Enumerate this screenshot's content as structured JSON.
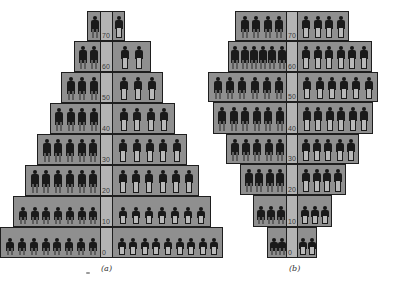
{
  "chart_data": [
    {
      "type": "bar",
      "subtype": "population-pyramid-isotype",
      "title": "",
      "caption": "(a)",
      "xlabel": "",
      "ylabel": "",
      "age_axis_ticks": [
        "0",
        "10",
        "20",
        "30",
        "40",
        "50",
        "60",
        "70"
      ],
      "categories": [
        "0",
        "10",
        "20",
        "30",
        "40",
        "50",
        "60",
        "70"
      ],
      "series": [
        {
          "name": "male (left)",
          "values": [
            8,
            7,
            6,
            5,
            4,
            3,
            2,
            1
          ]
        },
        {
          "name": "female (right)",
          "values": [
            9,
            7,
            6,
            5,
            4,
            3,
            2,
            1
          ]
        }
      ],
      "grid": false,
      "legend": "none",
      "colors": {
        "box": "#8f8f8f",
        "strip": "#b4b4b4",
        "figure": "#1a1a1a",
        "border": "#1e1e1e"
      }
    },
    {
      "type": "bar",
      "subtype": "population-pyramid-isotype",
      "title": "",
      "caption": "(b)",
      "xlabel": "",
      "ylabel": "",
      "age_axis_ticks": [
        "0",
        "10",
        "20",
        "30",
        "40",
        "50",
        "60",
        "70"
      ],
      "categories": [
        "0",
        "10",
        "20",
        "30",
        "40",
        "50",
        "60",
        "70"
      ],
      "series": [
        {
          "name": "male (left)",
          "values": [
            2,
            3,
            4,
            5,
            6,
            6,
            6,
            4
          ]
        },
        {
          "name": "female (right)",
          "values": [
            2,
            3,
            4,
            5,
            6,
            6,
            6,
            4
          ]
        }
      ],
      "grid": false,
      "legend": "none",
      "colors": {
        "box": "#8f8f8f",
        "strip": "#b4b4b4",
        "figure": "#1a1a1a",
        "border": "#1e1e1e"
      }
    }
  ],
  "layout": {
    "a": {
      "strip": [
        100,
        112
      ],
      "rows": [
        {
          "label": "70",
          "top": 11,
          "h": 30,
          "left": 87,
          "right": 125
        },
        {
          "label": "60",
          "top": 41,
          "h": 31,
          "left": 74,
          "right": 151
        },
        {
          "label": "50",
          "top": 72,
          "h": 31,
          "left": 61,
          "right": 163
        },
        {
          "label": "40",
          "top": 103,
          "h": 31,
          "left": 50,
          "right": 175
        },
        {
          "label": "30",
          "top": 134,
          "h": 31,
          "left": 37,
          "right": 187
        },
        {
          "label": "20",
          "top": 165,
          "h": 31,
          "left": 25,
          "right": 199
        },
        {
          "label": "10",
          "top": 196,
          "h": 31,
          "left": 13,
          "right": 211
        },
        {
          "label": "0",
          "top": 227,
          "h": 31,
          "left": 0,
          "right": 223
        }
      ],
      "caption_pos": [
        101,
        264
      ]
    },
    "b": {
      "strip": [
        286,
        297
      ],
      "rows": [
        {
          "label": "70",
          "top": 11,
          "h": 30,
          "left": 235,
          "right": 349
        },
        {
          "label": "60",
          "top": 41,
          "h": 31,
          "left": 228,
          "right": 372
        },
        {
          "label": "50",
          "top": 72,
          "h": 30,
          "left": 208,
          "right": 378
        },
        {
          "label": "40",
          "top": 102,
          "h": 32,
          "left": 213,
          "right": 373
        },
        {
          "label": "30",
          "top": 134,
          "h": 30,
          "left": 226,
          "right": 359
        },
        {
          "label": "20",
          "top": 164,
          "h": 31,
          "left": 240,
          "right": 346
        },
        {
          "label": "10",
          "top": 195,
          "h": 32,
          "left": 253,
          "right": 332
        },
        {
          "label": "0",
          "top": 227,
          "h": 31,
          "left": 267,
          "right": 317
        }
      ],
      "caption_pos": [
        289,
        264
      ]
    }
  }
}
